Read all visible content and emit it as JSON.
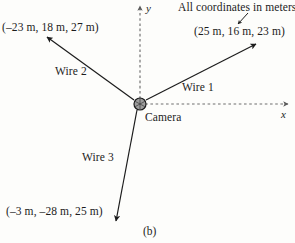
{
  "figure": {
    "panel_label": "(b)",
    "note": "All coordinates in meters",
    "origin_label": "Camera",
    "axes": {
      "x_label": "x",
      "y_label": "y"
    },
    "wires": [
      {
        "name": "Wire 1",
        "label": "Wire 1",
        "coordinates_text": "(25 m, 16 m, 23 m)",
        "coordinates": [
          25,
          16,
          23
        ],
        "units": "m"
      },
      {
        "name": "Wire 2",
        "label": "Wire 2",
        "coordinates_text": "(–23 m, 18 m, 27 m)",
        "coordinates": [
          -23,
          18,
          27
        ],
        "units": "m"
      },
      {
        "name": "Wire 3",
        "label": "Wire 3",
        "coordinates_text": "(–3 m, –28 m, 25 m)",
        "coordinates": [
          -3,
          -28,
          25
        ],
        "units": "m"
      }
    ],
    "colors": {
      "background": "#fdfdfb",
      "line": "#1c1c1c",
      "axis": "#6b6b6b",
      "camera_fill": "#9a9a9a",
      "camera_stroke": "#1c1c1c",
      "text": "#1c1c1c"
    }
  }
}
